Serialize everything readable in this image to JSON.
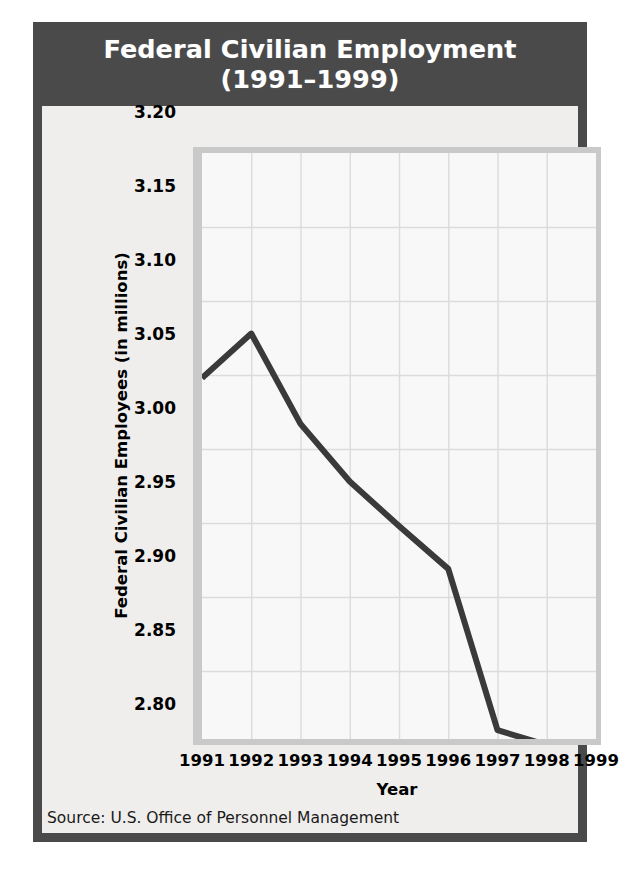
{
  "card": {
    "title_line1": "Federal Civilian Employment",
    "title_line2": "(1991–1999)",
    "source": "Source: U.S. Office of Personnel Management",
    "accent_dark": "#4a4a4a",
    "panel_bg": "#efeeec",
    "plot_bg": "#f8f8f8",
    "line_color": "#3a3a3a",
    "grid_color": "#dcdcdc"
  },
  "chart_data": {
    "type": "line",
    "title": "Federal Civilian Employment (1991–1999)",
    "xlabel": "Year",
    "ylabel": "Federal Civilian Employees (in millions)",
    "categories": [
      "1991",
      "1992",
      "1993",
      "1994",
      "1995",
      "1996",
      "1997",
      "1998",
      "1999"
    ],
    "x": [
      1991,
      1992,
      1993,
      1994,
      1995,
      1996,
      1997,
      1998,
      1999
    ],
    "values": [
      3.048,
      3.078,
      3.017,
      2.978,
      2.948,
      2.919,
      2.81,
      2.8,
      2.757
    ],
    "series": [
      {
        "name": "Federal Civilian Employees",
        "values": [
          3.048,
          3.078,
          3.017,
          2.978,
          2.948,
          2.919,
          2.81,
          2.8,
          2.757
        ]
      }
    ],
    "ylim": [
      2.757,
      3.2
    ],
    "yticks": [
      "3.20",
      "3.15",
      "3.10",
      "3.05",
      "3.00",
      "2.95",
      "2.90",
      "2.85",
      "2.80"
    ],
    "ytick_values": [
      3.2,
      3.15,
      3.1,
      3.05,
      3.0,
      2.95,
      2.9,
      2.85,
      2.8
    ],
    "xlim": [
      1991,
      1999
    ],
    "grid": true,
    "legend": "none",
    "units": "millions of employees"
  }
}
